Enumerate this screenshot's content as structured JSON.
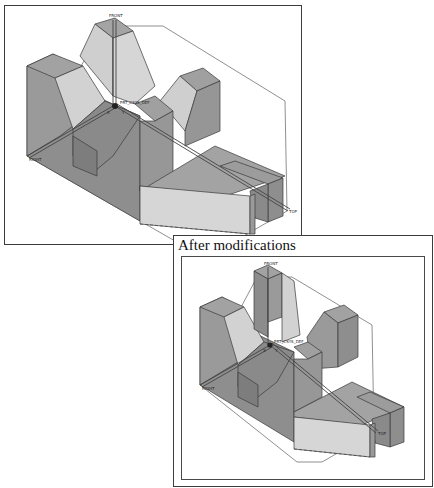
{
  "figure": {
    "panels": [
      {
        "id": "before",
        "caption": "",
        "datum_labels": {
          "front": "FRONT",
          "top": "TOP",
          "right": "RIGHT",
          "csys": "PRT_CSYS_DEF",
          "axis_x": "X",
          "axis_y": "Y",
          "axis_z": "Z"
        }
      },
      {
        "id": "after",
        "caption": "After modifications",
        "datum_labels": {
          "front": "FRONT",
          "top": "TOP",
          "right": "RIGHT",
          "csys": "PRT_CSYS_DEF",
          "axis_x": "X",
          "axis_y": "Y",
          "axis_z": "Z"
        }
      }
    ],
    "colors": {
      "face_light": "#d4d4d4",
      "face_mid": "#a6a6a6",
      "face_dark": "#8c8c8c",
      "face_top": "#9a9a9a",
      "edge": "#3a3a3a",
      "datum_line": "#555555",
      "background": "#ffffff"
    }
  }
}
